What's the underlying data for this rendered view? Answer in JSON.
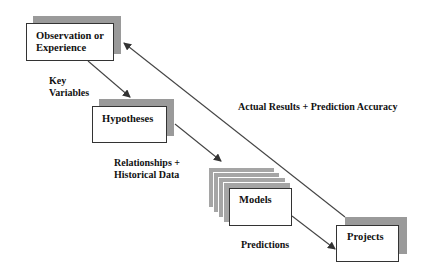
{
  "diagram": {
    "nodes": [
      {
        "id": "observation",
        "label_line1": "Observation or",
        "label_line2": "Experience"
      },
      {
        "id": "hypotheses",
        "label": "Hypotheses"
      },
      {
        "id": "models",
        "label": "Models"
      },
      {
        "id": "projects",
        "label": "Projects"
      }
    ],
    "edges": [
      {
        "from": "observation",
        "to": "hypotheses",
        "label_line1": "Key",
        "label_line2": "Variables"
      },
      {
        "from": "hypotheses",
        "to": "models",
        "label_line1": "Relationships  +",
        "label_line2": "Historical Data"
      },
      {
        "from": "models",
        "to": "projects",
        "label": "Predictions"
      },
      {
        "from": "projects",
        "to": "observation",
        "label": "Actual Results + Prediction Accuracy"
      }
    ],
    "colors": {
      "shadow": "#9a9a9a",
      "line": "#333333",
      "background": "#ffffff"
    }
  }
}
